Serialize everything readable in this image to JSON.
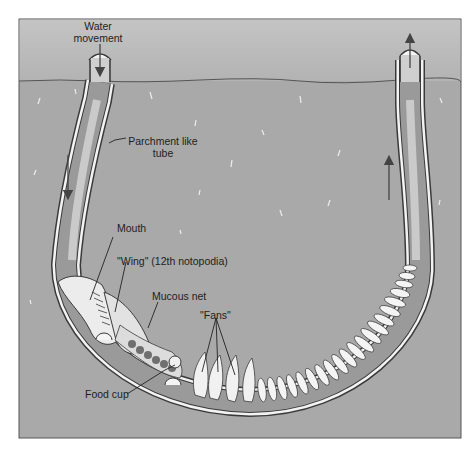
{
  "figure": {
    "colors": {
      "water": "#b9b9b9",
      "sediment": "#a9a9a9",
      "frame": "#555555",
      "tube_wall": "#f2f2f2",
      "tube_outline": "#3a3a3a",
      "tube_interior": "#8f8f8f",
      "worm_body": "#e6e6e6",
      "arrow": "#444444"
    },
    "flow_arrows": [
      {
        "name": "inflow-top",
        "direction": "down"
      },
      {
        "name": "inflow-left-tube",
        "direction": "down"
      },
      {
        "name": "outflow-right-tube",
        "direction": "up"
      },
      {
        "name": "outflow-top",
        "direction": "up"
      }
    ]
  },
  "labels": {
    "water_movement_line1": "Water",
    "water_movement_line2": "movement",
    "parchment_line1": "Parchment like",
    "parchment_line2": "tube",
    "mouth": "Mouth",
    "wing": "\"Wing\" (12th notopodia)",
    "mucous_net": "Mucous net",
    "fans": "\"Fans\"",
    "food_cup": "Food cup"
  }
}
